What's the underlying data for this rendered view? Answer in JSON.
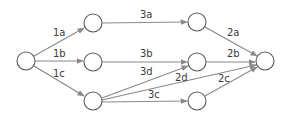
{
  "diagram": {
    "type": "directed-graph",
    "colors": {
      "edge": "#8a8a8a",
      "node_stroke": "#5a5a5a",
      "label": "#3a3a3a",
      "background": "#ffffff"
    },
    "nodes": [
      {
        "id": "s",
        "x": 26,
        "y": 61
      },
      {
        "id": "n1",
        "x": 93,
        "y": 23
      },
      {
        "id": "n2",
        "x": 93,
        "y": 62
      },
      {
        "id": "n3",
        "x": 93,
        "y": 101
      },
      {
        "id": "n4",
        "x": 197,
        "y": 22
      },
      {
        "id": "n5",
        "x": 197,
        "y": 62
      },
      {
        "id": "n6",
        "x": 197,
        "y": 101
      },
      {
        "id": "t",
        "x": 265,
        "y": 61
      }
    ],
    "edges": [
      {
        "from": "s",
        "to": "n1",
        "label": "1a"
      },
      {
        "from": "s",
        "to": "n2",
        "label": "1b"
      },
      {
        "from": "s",
        "to": "n3",
        "label": "1c"
      },
      {
        "from": "n1",
        "to": "n4",
        "label": "3a"
      },
      {
        "from": "n2",
        "to": "n5",
        "label": "3b"
      },
      {
        "from": "n3",
        "to": "n5",
        "label": "3d"
      },
      {
        "from": "n3",
        "to": "n6",
        "label": "3c"
      },
      {
        "from": "n3",
        "to": "t",
        "label": "2d"
      },
      {
        "from": "n4",
        "to": "t",
        "label": "2a"
      },
      {
        "from": "n5",
        "to": "t",
        "label": "2b"
      },
      {
        "from": "n6",
        "to": "t",
        "label": "2c"
      }
    ]
  }
}
